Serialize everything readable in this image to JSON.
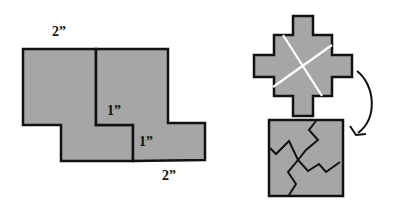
{
  "colors": {
    "fill": "#a6a6a6",
    "stroke": "#111111",
    "cut_line": "#ffffff",
    "background": "#ffffff"
  },
  "left_figure": {
    "labels": {
      "top_width": "2”",
      "inner_step_1": "1”",
      "inner_step_2": "1”",
      "bottom_width": "2”"
    }
  },
  "right_figure": {
    "cross_shape": "stepped-cross-with-two-white-cut-lines",
    "arrow": "curved-arrow-down",
    "square_shape": "square-divided-into-four-interlocking-pieces"
  }
}
